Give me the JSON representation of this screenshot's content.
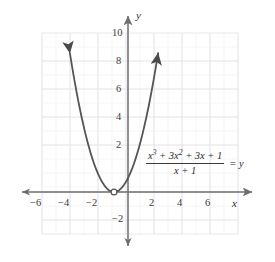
{
  "figure": {
    "kind": "cartesian-graph",
    "background_color": "#ffffff",
    "curve_color": "#555555",
    "axis_color": "#6e6e6e",
    "grid_color": "#e9e7ea",
    "grid_minor_color": "#f1eff2",
    "label_color": "#3b3b3b"
  },
  "axes": {
    "x_axis_name": "x",
    "y_axis_name": "y",
    "x_ticks": [
      {
        "label": "−6",
        "value": -6
      },
      {
        "label": "−4",
        "value": -4
      },
      {
        "label": "−2",
        "value": -2
      },
      {
        "label": "2",
        "value": 2
      },
      {
        "label": "4",
        "value": 4
      },
      {
        "label": "6",
        "value": 6
      }
    ],
    "y_ticks": [
      {
        "label": "10",
        "value": 10
      },
      {
        "label": "8",
        "value": 8
      },
      {
        "label": "6",
        "value": 6
      },
      {
        "label": "4",
        "value": 4
      },
      {
        "label": "2",
        "value": 2
      },
      {
        "label": "−2",
        "value": -2
      }
    ]
  },
  "equation": {
    "numerator_parts": [
      "x",
      "3",
      " + 3x",
      "2",
      " + 3x + 1"
    ],
    "numerator_text": "x³ + 3x² + 3x + 1",
    "numerator_base_1": "x",
    "numerator_exp_1": "3",
    "numerator_mid": " + 3",
    "numerator_base_2": "x",
    "numerator_exp_2": "2",
    "numerator_tail": " + 3x + 1",
    "denominator_text": "x + 1",
    "equals_y_text": "= y"
  },
  "chart_data": {
    "type": "line",
    "title": "",
    "xlabel": "x",
    "ylabel": "y",
    "xlim": [
      -7,
      7
    ],
    "ylim": [
      -3,
      11
    ],
    "grid": true,
    "legend": "none",
    "series": [
      {
        "name": "(x^3 + 3x^2 + 3x + 1)/(x + 1)",
        "equivalent": "y = (x + 1)^2, x ≠ -1",
        "x": [
          -4.15,
          -4.0,
          -3.5,
          -3.0,
          -2.5,
          -2.0,
          -1.5,
          -1.0,
          -0.5,
          0.0,
          0.5,
          1.0,
          1.5,
          2.0,
          2.15
        ],
        "y": [
          9.92,
          9.0,
          6.25,
          4.0,
          2.25,
          1.0,
          0.25,
          0.0,
          0.25,
          1.0,
          2.25,
          4.0,
          6.25,
          9.0,
          9.92
        ],
        "arrow_start": true,
        "arrow_end": true
      }
    ],
    "hole": {
      "x": -1,
      "y": 0,
      "filled": false,
      "note": "removable discontinuity at x = -1"
    },
    "annotations": [
      {
        "text": "(x³ + 3x² + 3x + 1)/(x + 1) = y",
        "x": 2.3,
        "y": 2.2
      }
    ]
  }
}
